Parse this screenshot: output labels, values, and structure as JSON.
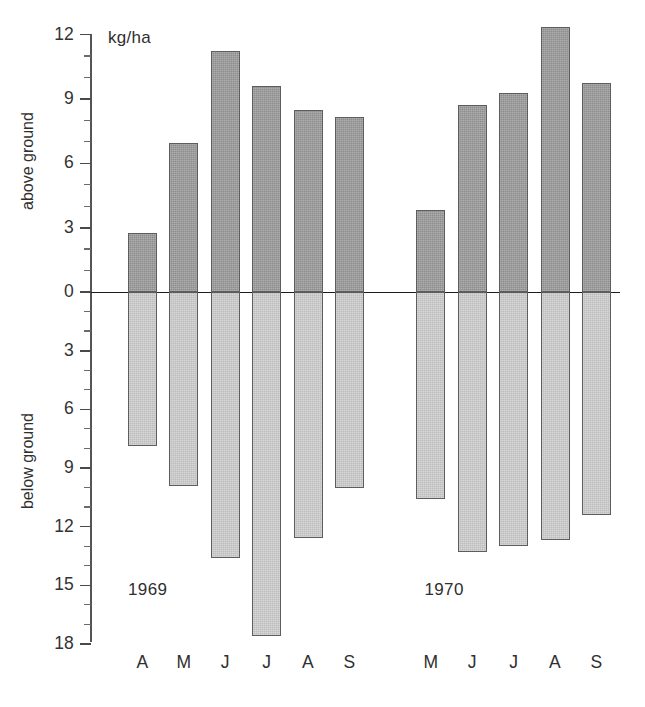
{
  "chart_data": {
    "type": "bar",
    "title": "",
    "subtitle": "",
    "unit_caption": "kg/ha",
    "xlabel": "",
    "ylabel_above": "above ground",
    "ylabel_below": "below ground",
    "orientation": "vertical",
    "grid": false,
    "legend": "none",
    "axis": {
      "above_ticks": [
        0,
        3,
        6,
        9,
        12
      ],
      "below_ticks": [
        0,
        3,
        6,
        9,
        12,
        15,
        18
      ],
      "above_minor_step": 1,
      "below_minor_step": 1,
      "above_max": 12,
      "below_max": 18,
      "above_tick_labels": [
        "0",
        "3",
        "6",
        "9",
        "12"
      ],
      "below_tick_labels": [
        "0",
        "3",
        "6",
        "9",
        "12",
        "15",
        "18"
      ]
    },
    "groups": [
      {
        "name": "1969",
        "categories": [
          "A",
          "M",
          "J",
          "J",
          "A",
          "S"
        ],
        "series": [
          {
            "name": "above ground",
            "values": [
              2.75,
              6.95,
              11.25,
              9.6,
              8.5,
              8.15
            ]
          },
          {
            "name": "below ground",
            "values": [
              7.9,
              9.9,
              13.6,
              17.6,
              12.6,
              10.0
            ]
          }
        ]
      },
      {
        "name": "1970",
        "categories": [
          "M",
          "J",
          "J",
          "A",
          "S"
        ],
        "series": [
          {
            "name": "above ground",
            "values": [
              3.8,
              8.7,
              9.3,
              12.35,
              9.75
            ]
          },
          {
            "name": "below ground",
            "values": [
              10.6,
              13.3,
              13.0,
              12.7,
              11.4
            ]
          }
        ]
      }
    ]
  },
  "colors": {
    "above_ground_fill": "#8d8d8d",
    "below_ground_fill": "#bdbdbd",
    "bar_border": "#5d5d5d",
    "axis": "#555555",
    "zero_line": "#1d1d1d",
    "text": "#2f2f2f",
    "background": "#ffffff"
  }
}
